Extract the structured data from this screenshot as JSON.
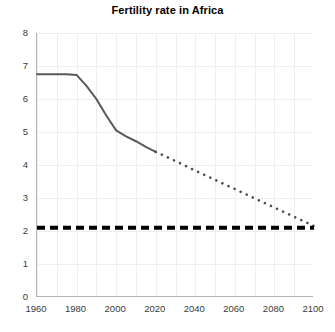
{
  "chart_data": {
    "type": "line",
    "title": "Fertility rate in Africa",
    "xlabel": "",
    "ylabel": "",
    "xlim": [
      1960,
      2100
    ],
    "ylim": [
      0,
      8
    ],
    "xticks": [
      1960,
      1980,
      2000,
      2020,
      2040,
      2060,
      2080,
      2100
    ],
    "yticks": [
      0,
      1,
      2,
      3,
      4,
      5,
      6,
      7,
      8
    ],
    "grid": true,
    "legend": "none",
    "series": [
      {
        "name": "Fertility rate (historical)",
        "style": "solid",
        "color": "#595959",
        "x": [
          1960,
          1965,
          1970,
          1975,
          1980,
          1985,
          1990,
          1995,
          2000,
          2005,
          2010,
          2015,
          2020
        ],
        "values": [
          6.75,
          6.75,
          6.75,
          6.75,
          6.73,
          6.4,
          6.0,
          5.5,
          5.05,
          4.87,
          4.72,
          4.55,
          4.4
        ]
      },
      {
        "name": "Fertility rate (projection)",
        "style": "dotted",
        "color": "#4d4d4d",
        "x": [
          2020,
          2030,
          2040,
          2050,
          2060,
          2070,
          2080,
          2090,
          2100
        ],
        "values": [
          4.4,
          4.12,
          3.83,
          3.55,
          3.27,
          2.99,
          2.71,
          2.43,
          2.15
        ]
      },
      {
        "name": "Replacement level",
        "style": "dashed",
        "color": "#000000",
        "x": [
          1960,
          2100
        ],
        "values": [
          2.1,
          2.1
        ]
      }
    ]
  }
}
